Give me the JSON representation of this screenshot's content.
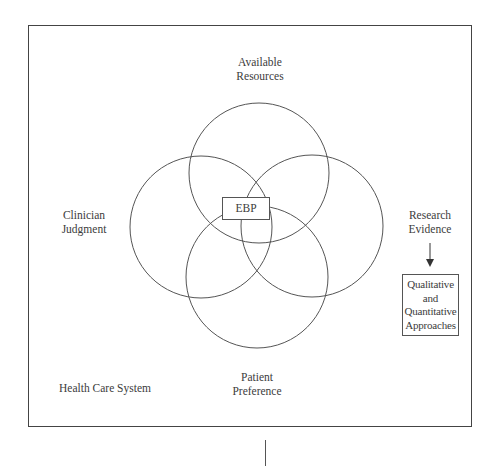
{
  "diagram": {
    "type": "venn",
    "outer_frame_label": "Health Care System",
    "center_label": "EBP",
    "circles": [
      {
        "id": "available-resources",
        "label_lines": [
          "Available",
          "Resources"
        ],
        "cx": 259,
        "cy": 173,
        "r": 70
      },
      {
        "id": "clinician-judgment",
        "label_lines": [
          "Clinician",
          "Judgment"
        ],
        "cx": 201,
        "cy": 227,
        "r": 71
      },
      {
        "id": "research-evidence",
        "label_lines": [
          "Research",
          "Evidence"
        ],
        "cx": 312,
        "cy": 226,
        "r": 71
      },
      {
        "id": "patient-preference",
        "label_lines": [
          "Patient",
          "Preference"
        ],
        "cx": 257,
        "cy": 277,
        "r": 71
      }
    ],
    "labels": {
      "available_resources": [
        "Available",
        "Resources"
      ],
      "clinician_judgment": [
        "Clinician",
        "Judgment"
      ],
      "research_evidence": [
        "Research",
        "Evidence"
      ],
      "patient_preference": [
        "Patient",
        "Preference"
      ],
      "health_care_system": "Health Care System",
      "ebp": "EBP"
    },
    "research_approaches_box": {
      "lines": [
        "Qualitative",
        "and",
        "Quantitative",
        "Approaches"
      ]
    },
    "arrow": {
      "from": "Research Evidence",
      "to": "Qualitative and Quantitative Approaches",
      "direction": "down"
    },
    "colors": {
      "line": "#555555",
      "text": "#3c3c3c",
      "background": "#ffffff"
    }
  }
}
